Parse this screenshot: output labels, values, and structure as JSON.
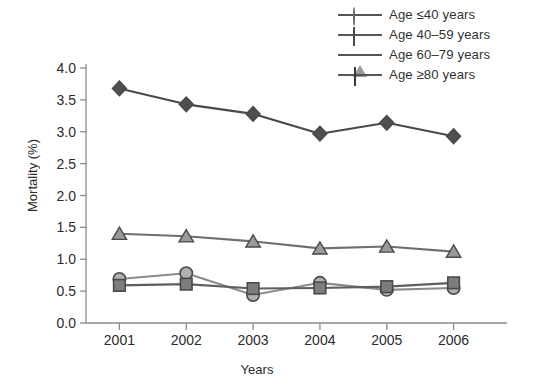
{
  "chart_data": {
    "type": "line",
    "title": "",
    "xlabel": "Years",
    "ylabel": "Mortality (%)",
    "categories": [
      "2001",
      "2002",
      "2003",
      "2004",
      "2005",
      "2006"
    ],
    "xlim": [
      2000.5,
      2006.5
    ],
    "ylim": [
      0.0,
      4.0
    ],
    "yticks": [
      "0.0",
      "0.5",
      "1.0",
      "1.5",
      "2.0",
      "2.5",
      "3.0",
      "3.5",
      "4.0"
    ],
    "ytick_values": [
      0.0,
      0.5,
      1.0,
      1.5,
      2.0,
      2.5,
      3.0,
      3.5,
      4.0
    ],
    "grid": false,
    "legend_position": "top-right",
    "series": [
      {
        "name": "Age ≤40 years",
        "marker": "circle",
        "color": "#b0b0b0",
        "line_color": "#8c8c8c",
        "values": [
          0.69,
          0.78,
          0.44,
          0.63,
          0.52,
          0.55
        ]
      },
      {
        "name": "Age 40–59 years",
        "marker": "square",
        "color": "#7d7d7d",
        "line_color": "#5e5e5e",
        "values": [
          0.59,
          0.61,
          0.54,
          0.55,
          0.57,
          0.63
        ]
      },
      {
        "name": "Age 60–79 years",
        "marker": "triangle",
        "color": "#9a9a9a",
        "line_color": "#6f6f6f",
        "values": [
          1.4,
          1.36,
          1.28,
          1.17,
          1.2,
          1.12
        ]
      },
      {
        "name": "Age ≥80 years",
        "marker": "diamond",
        "color": "#4f4f4f",
        "line_color": "#4a4a4a",
        "values": [
          3.68,
          3.43,
          3.28,
          2.97,
          3.14,
          2.93
        ]
      }
    ]
  },
  "legend": {
    "items": [
      {
        "label": "Age ≤40 years",
        "marker": "circle-marker"
      },
      {
        "label": "Age 40–59 years",
        "marker": "square-marker"
      },
      {
        "label": "Age 60–79 years",
        "marker": "triangle-marker"
      },
      {
        "label": "Age ≥80 years",
        "marker": "diamond-marker"
      }
    ]
  },
  "axes": {
    "x_title": "Years",
    "y_title": "Mortality (%)"
  }
}
